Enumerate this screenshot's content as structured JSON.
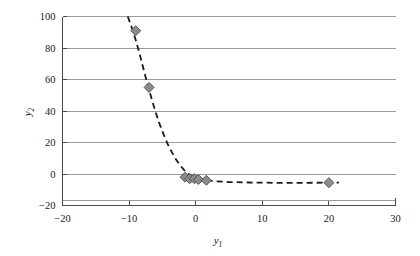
{
  "chart_data": {
    "type": "scatter",
    "title": "",
    "xlabel": "y1",
    "ylabel": "y2",
    "xlabel_base": "y",
    "xlabel_sub": "1",
    "ylabel_base": "y",
    "ylabel_sub": "2",
    "xlim": [
      -20,
      30
    ],
    "ylim": [
      -20,
      100
    ],
    "xticks": [
      -20,
      -10,
      0,
      10,
      20,
      30
    ],
    "xtick_labels": [
      "−20",
      "−10",
      "0",
      "10",
      "20",
      "30"
    ],
    "yticks": [
      -20,
      0,
      20,
      40,
      60,
      80,
      100
    ],
    "ytick_labels": [
      "−20",
      "0",
      "20",
      "40",
      "60",
      "80",
      "100"
    ],
    "gridlines_y": [
      100,
      80,
      60,
      40,
      20,
      0,
      -17
    ],
    "grid": true,
    "legend": null,
    "marker": "diamond",
    "marker_color": "#8c8c8c",
    "marker_edge_color": "#555555",
    "line_style": "dashed",
    "line_color": "#1a1a1a",
    "points": [
      {
        "x": -9.0,
        "y": 91.0
      },
      {
        "x": -7.0,
        "y": 55.0
      },
      {
        "x": -1.6,
        "y": -2.0
      },
      {
        "x": -0.9,
        "y": -3.0
      },
      {
        "x": -0.2,
        "y": -3.0
      },
      {
        "x": 0.4,
        "y": -3.5
      },
      {
        "x": 1.6,
        "y": -4.0
      },
      {
        "x": 20.0,
        "y": -5.5
      }
    ],
    "fit_curve": [
      {
        "x": -10.2,
        "y": 100.0
      },
      {
        "x": -9.6,
        "y": 93.0
      },
      {
        "x": -9.0,
        "y": 85.0
      },
      {
        "x": -8.4,
        "y": 76.0
      },
      {
        "x": -7.8,
        "y": 66.0
      },
      {
        "x": -7.2,
        "y": 56.5
      },
      {
        "x": -6.6,
        "y": 47.5
      },
      {
        "x": -6.0,
        "y": 39.0
      },
      {
        "x": -5.4,
        "y": 31.5
      },
      {
        "x": -4.8,
        "y": 25.0
      },
      {
        "x": -4.2,
        "y": 19.0
      },
      {
        "x": -3.6,
        "y": 14.0
      },
      {
        "x": -3.0,
        "y": 9.5
      },
      {
        "x": -2.4,
        "y": 5.8
      },
      {
        "x": -1.8,
        "y": 2.8
      },
      {
        "x": -1.2,
        "y": 0.5
      },
      {
        "x": -0.6,
        "y": -1.2
      },
      {
        "x": 0.0,
        "y": -2.4
      },
      {
        "x": 0.8,
        "y": -3.4
      },
      {
        "x": 1.6,
        "y": -4.0
      },
      {
        "x": 3.0,
        "y": -4.6
      },
      {
        "x": 5.0,
        "y": -5.1
      },
      {
        "x": 8.0,
        "y": -5.4
      },
      {
        "x": 12.0,
        "y": -5.6
      },
      {
        "x": 16.0,
        "y": -5.6
      },
      {
        "x": 20.0,
        "y": -5.5
      },
      {
        "x": 21.5,
        "y": -5.4
      }
    ]
  }
}
